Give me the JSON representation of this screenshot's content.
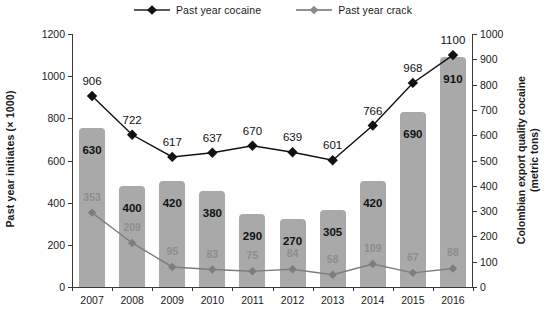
{
  "chart_data": {
    "type": "bar",
    "title": "",
    "categories": [
      "2007",
      "2008",
      "2009",
      "2010",
      "2011",
      "2012",
      "2013",
      "2014",
      "2015",
      "2016"
    ],
    "xlabel": "",
    "ylabel": "Past year initiates (× 1000)",
    "ylabel_right": "Colombian export quality cocaine (metric tons)",
    "ylim": [
      0,
      1200
    ],
    "ylim_right": [
      0,
      1000
    ],
    "yticks": [
      0,
      200,
      400,
      600,
      800,
      1000,
      1200
    ],
    "yticks_right": [
      0,
      100,
      200,
      300,
      400,
      500,
      600,
      700,
      800,
      900,
      1000
    ],
    "grid": false,
    "legend_position": "top-center",
    "series": [
      {
        "name": "Colombian export quality cocaine",
        "type": "bar",
        "axis": "right",
        "unit": "metric tons",
        "values": [
          630,
          400,
          420,
          380,
          290,
          270,
          305,
          420,
          690,
          910
        ],
        "color": "#a9a9a9",
        "label_color": "#111111"
      },
      {
        "name": "Past year cocaine",
        "type": "line",
        "axis": "left",
        "unit": "thousands of initiates",
        "values": [
          906,
          722,
          617,
          637,
          670,
          639,
          601,
          766,
          968,
          1100
        ],
        "color": "#111111",
        "marker": "diamond"
      },
      {
        "name": "Past year crack",
        "type": "line",
        "axis": "left",
        "unit": "thousands of initiates",
        "values": [
          353,
          209,
          95,
          83,
          75,
          84,
          58,
          109,
          67,
          88
        ],
        "color": "#7d7d7d",
        "marker": "diamond"
      }
    ]
  },
  "legend": {
    "items": [
      {
        "label": "Past year cocaine",
        "color": "#111111"
      },
      {
        "label": "Past year crack",
        "color": "#8a8a8a"
      }
    ]
  },
  "axes": {
    "left_title": "Past year initiates (× 1000)",
    "right_title_line1": "Colombian export quality cocaine",
    "right_title_line2": "(metric tons)"
  }
}
